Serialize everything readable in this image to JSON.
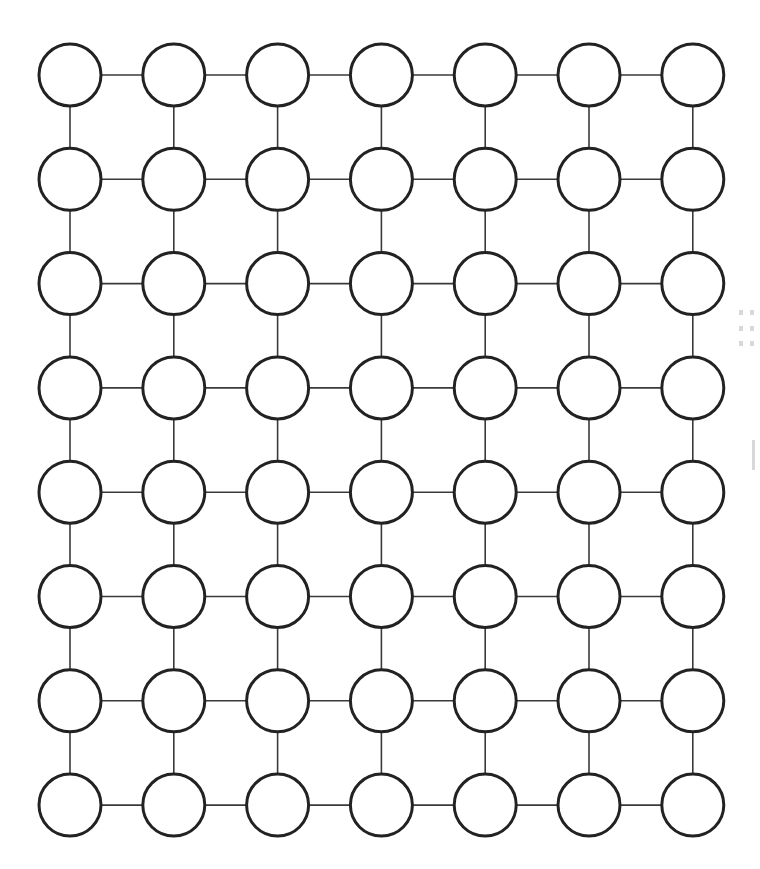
{
  "diagram": {
    "type": "grid-graph",
    "rows": 8,
    "columns": 7,
    "node_shape": "circle",
    "node_fill": "#ffffff",
    "node_stroke": "#222222",
    "edge_color": "#3a3a3a",
    "layout": {
      "origin_x": 70,
      "origin_y": 75,
      "spacing_x": 103.8,
      "spacing_y": 104.3,
      "node_radius": 31
    },
    "connections": "orthogonal neighbors (horizontal and vertical)",
    "labels": []
  }
}
